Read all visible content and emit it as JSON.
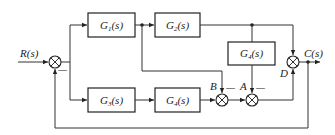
{
  "diagram": {
    "type": "control-system block diagram",
    "input": {
      "label": "R(s)"
    },
    "output": {
      "label": "C(s)"
    },
    "blocks": [
      {
        "id": "g1",
        "name": "G",
        "sub": "1",
        "arg": "(s)"
      },
      {
        "id": "g2",
        "name": "G",
        "sub": "2",
        "arg": "(s)"
      },
      {
        "id": "g3",
        "name": "G",
        "sub": "3",
        "arg": "(s)"
      },
      {
        "id": "g4_bottom",
        "name": "G",
        "sub": "4",
        "arg": "(s)"
      },
      {
        "id": "g4_right",
        "name": "G",
        "sub": "4",
        "arg": "(s)"
      }
    ],
    "summing_junctions": [
      {
        "id": "s_in",
        "label": "",
        "minus_sign": "—"
      },
      {
        "id": "B",
        "label": "B",
        "minus_sign": "—"
      },
      {
        "id": "A",
        "label": "A",
        "minus_sign": "—"
      },
      {
        "id": "D",
        "label": "D",
        "minus_sign": ""
      }
    ]
  }
}
